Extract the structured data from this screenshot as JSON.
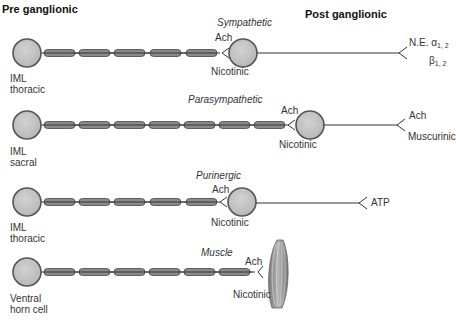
{
  "headers": {
    "pre": "Pre ganglionic",
    "post": "Post ganglionic"
  },
  "colors": {
    "soma_fill": "#c4c4c4",
    "soma_stroke": "#555555",
    "myelin_fill": "#8a8a8a",
    "axon": "#333333",
    "muscle_fill": "#9a9a9a"
  },
  "pathways": [
    {
      "title": "Sympathetic",
      "origin_line1": "IML",
      "origin_line2": "thoracic",
      "pre_transmitter": "Ach",
      "pre_receptor": "Nicotinic",
      "post_transmitter": "N.E.",
      "post_receptor_a": "α",
      "post_receptor_a_sub": "1, 2",
      "post_receptor_b": "β",
      "post_receptor_b_sub": "1, 2"
    },
    {
      "title": "Parasympathetic",
      "origin_line1": "IML",
      "origin_line2": "sacral",
      "pre_transmitter": "Ach",
      "pre_receptor": "Nicotinic",
      "post_transmitter": "Ach",
      "post_receptor": "Muscurinic"
    },
    {
      "title": "Purinergic",
      "origin_line1": "IML",
      "origin_line2": "thoracic",
      "pre_transmitter": "Ach",
      "pre_receptor": "Nicotinic",
      "post_transmitter": "ATP"
    },
    {
      "title": "Muscle",
      "origin_line1": "Ventral",
      "origin_line2": "horn cell",
      "pre_transmitter": "Ach",
      "pre_receptor": "Nicotinic"
    }
  ]
}
